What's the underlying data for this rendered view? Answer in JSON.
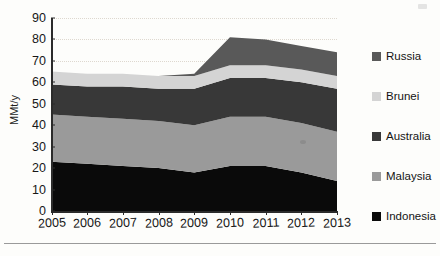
{
  "chart_data": {
    "type": "area",
    "stacked": true,
    "title": "",
    "xlabel": "",
    "ylabel": "MMt/y",
    "ylim": [
      0,
      90
    ],
    "ytick_step": 10,
    "yticks": [
      "0",
      "10",
      "20",
      "30",
      "40",
      "50",
      "60",
      "70",
      "80",
      "90"
    ],
    "categories": [
      "2005",
      "2006",
      "2007",
      "2008",
      "2009",
      "2010",
      "2011",
      "2012",
      "2013"
    ],
    "x": [
      2005,
      2006,
      2007,
      2008,
      2009,
      2010,
      2011,
      2012,
      2013
    ],
    "grid": "horizontal-dotted",
    "legend_position": "right",
    "stack_order_bottom_to_top": [
      "Indonesia",
      "Malaysia",
      "Australia",
      "Brunei",
      "Russia"
    ],
    "series": [
      {
        "name": "Indonesia",
        "color": "#0a0a0a",
        "values": [
          23,
          22,
          21,
          20,
          18,
          21,
          21,
          18,
          14
        ]
      },
      {
        "name": "Malaysia",
        "color": "#9a9a9a",
        "values": [
          22,
          22,
          22,
          22,
          22,
          23,
          23,
          23,
          23
        ]
      },
      {
        "name": "Australia",
        "color": "#383838",
        "values": [
          14,
          14,
          15,
          15,
          17,
          18,
          18,
          19,
          20
        ]
      },
      {
        "name": "Brunei",
        "color": "#d4d4d4",
        "values": [
          6,
          6,
          6,
          6,
          6,
          6,
          6,
          6,
          6
        ]
      },
      {
        "name": "Russia",
        "color": "#595959",
        "values": [
          0,
          0,
          0,
          0,
          1,
          13,
          12,
          11,
          11
        ]
      }
    ],
    "totals": [
      65,
      64,
      64,
      63,
      64,
      81,
      80,
      77,
      74
    ]
  },
  "legend": {
    "items": [
      {
        "label": "Russia",
        "color": "#595959"
      },
      {
        "label": "Brunei",
        "color": "#d4d4d4"
      },
      {
        "label": "Australia",
        "color": "#383838"
      },
      {
        "label": "Malaysia",
        "color": "#9a9a9a"
      },
      {
        "label": "Indonesia",
        "color": "#0a0a0a"
      }
    ]
  }
}
